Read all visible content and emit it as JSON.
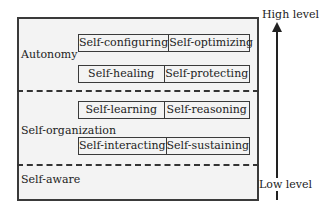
{
  "diagram": {
    "levels": [
      {
        "name": "Autonomy",
        "rows": [
          [
            "Self-configuring",
            "Self-optimizing"
          ],
          [
            "Self-healing",
            "Self-protecting"
          ]
        ]
      },
      {
        "name": "Self-organization",
        "rows": [
          [
            "Self-learning",
            "Self-reasoning"
          ],
          [
            "Self-interacting",
            "Self-sustaining"
          ]
        ]
      },
      {
        "name": "Self-aware",
        "rows": []
      }
    ],
    "axis": {
      "top_label": "High level",
      "bottom_label": "Low level"
    }
  }
}
